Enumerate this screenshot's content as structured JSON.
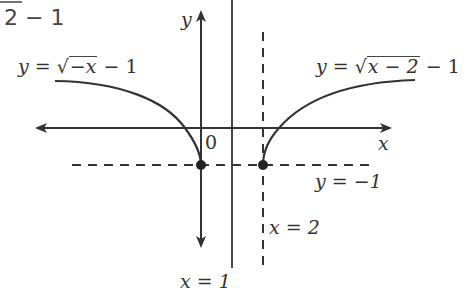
{
  "header": {
    "partial_text": "2 − 1"
  },
  "diagram": {
    "axes": {
      "x_label": "x",
      "y_label": "y",
      "origin_label": "0"
    },
    "curves": [
      {
        "name": "left-curve",
        "label_prefix": "y = ",
        "sqrt_arg": "−x",
        "label_suffix": " − 1",
        "equation": "y = √(−x) − 1"
      },
      {
        "name": "right-curve",
        "label_prefix": "y = ",
        "sqrt_arg": "x − 2",
        "label_suffix": " − 1",
        "equation": "y = √(x − 2) − 1"
      }
    ],
    "lines": {
      "x_eq_1": "x = 1",
      "x_eq_2": "x  = 2",
      "y_eq_neg1": "y = −1"
    },
    "points": [
      {
        "x": 0,
        "y": -1
      },
      {
        "x": 2,
        "y": -1
      }
    ],
    "colors": {
      "stroke": "#333333",
      "background": "#ffffff"
    }
  }
}
